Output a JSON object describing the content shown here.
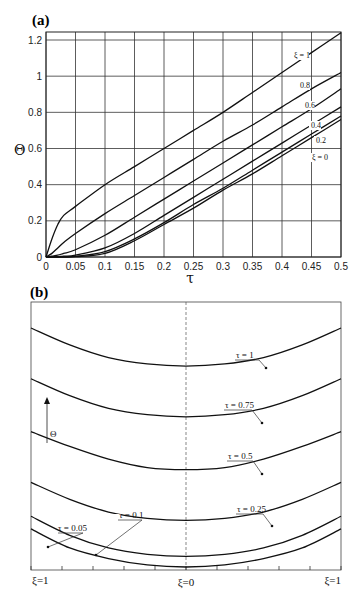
{
  "chart_data": [
    {
      "panel": "(a)",
      "type": "line",
      "title": "",
      "xlabel": "τ",
      "ylabel": "Θ",
      "xlim": [
        0,
        0.5
      ],
      "ylim": [
        0,
        1.25
      ],
      "grid": true,
      "x_ticks": [
        "0",
        "0.05",
        "0.1",
        "0.15",
        "0.2",
        "0.25",
        "0.3",
        "0.35",
        "0.4",
        "0.45",
        "0.5"
      ],
      "y_ticks": [
        "0",
        "0.2",
        "0.4",
        "0.6",
        "0.8",
        "1",
        "1.2"
      ],
      "x": [
        0,
        0.01,
        0.02,
        0.03,
        0.05,
        0.1,
        0.15,
        0.2,
        0.25,
        0.3,
        0.35,
        0.4,
        0.45,
        0.5
      ],
      "series": [
        {
          "name": "ξ=1",
          "label": "ξ = 1",
          "values": [
            0,
            0.1,
            0.18,
            0.23,
            0.28,
            0.4,
            0.5,
            0.6,
            0.7,
            0.8,
            0.91,
            1.02,
            1.13,
            1.24
          ]
        },
        {
          "name": "ξ=0.8",
          "label": "0.8",
          "values": [
            0,
            0.02,
            0.05,
            0.08,
            0.13,
            0.24,
            0.34,
            0.44,
            0.54,
            0.64,
            0.73,
            0.83,
            0.93,
            1.02
          ]
        },
        {
          "name": "ξ=0.6",
          "label": "0.6",
          "values": [
            0,
            0.005,
            0.01,
            0.02,
            0.04,
            0.12,
            0.22,
            0.32,
            0.42,
            0.52,
            0.62,
            0.72,
            0.82,
            0.93
          ]
        },
        {
          "name": "ξ=0.4",
          "label": "0.4",
          "values": [
            0,
            0,
            0.002,
            0.005,
            0.01,
            0.05,
            0.13,
            0.23,
            0.33,
            0.43,
            0.53,
            0.63,
            0.73,
            0.83
          ]
        },
        {
          "name": "ξ=0.2",
          "label": "0.2",
          "values": [
            0,
            0,
            0,
            0.001,
            0.003,
            0.03,
            0.1,
            0.19,
            0.29,
            0.38,
            0.48,
            0.58,
            0.68,
            0.78
          ]
        },
        {
          "name": "ξ=0",
          "label": "ξ = 0",
          "values": [
            0,
            0,
            0,
            0,
            0.002,
            0.02,
            0.09,
            0.18,
            0.27,
            0.37,
            0.46,
            0.56,
            0.66,
            0.76
          ]
        }
      ]
    },
    {
      "panel": "(b)",
      "type": "line",
      "title": "",
      "xlabel": "ξ",
      "ylabel": "Θ",
      "x_ticks": [
        "ξ=1",
        "ξ=0",
        "ξ=1"
      ],
      "annotation": "Θ (vertical arrow)",
      "centerline": "dashed at ξ=0",
      "x": [
        -1,
        -0.75,
        -0.5,
        -0.25,
        0,
        0.25,
        0.5,
        0.75,
        1
      ],
      "series": [
        {
          "name": "τ=1",
          "label": "τ = 1",
          "values": [
            1.13,
            1.05,
            0.99,
            0.96,
            0.95,
            0.96,
            0.99,
            1.05,
            1.13
          ]
        },
        {
          "name": "τ=0.75",
          "label": "τ = 0.75",
          "values": [
            0.89,
            0.81,
            0.75,
            0.72,
            0.71,
            0.72,
            0.75,
            0.81,
            0.89
          ]
        },
        {
          "name": "τ=0.5",
          "label": "τ = 0.5",
          "values": [
            0.64,
            0.57,
            0.51,
            0.47,
            0.46,
            0.47,
            0.51,
            0.57,
            0.64
          ]
        },
        {
          "name": "τ=0.25",
          "label": "τ = 0.25",
          "values": [
            0.4,
            0.32,
            0.26,
            0.23,
            0.22,
            0.23,
            0.26,
            0.32,
            0.4
          ]
        },
        {
          "name": "τ=0.1",
          "label": "τ = 0.1",
          "values": [
            0.24,
            0.15,
            0.09,
            0.06,
            0.05,
            0.06,
            0.09,
            0.15,
            0.24
          ]
        },
        {
          "name": "τ=0.05",
          "label": "τ = 0.05",
          "values": [
            0.18,
            0.09,
            0.04,
            0.01,
            0.0,
            0.01,
            0.04,
            0.09,
            0.18
          ]
        }
      ]
    }
  ],
  "labels": {
    "panel_a": "(a)",
    "panel_b": "(b)",
    "tau": "τ",
    "theta": "Θ",
    "xi_left": "ξ=1",
    "xi_center": "ξ=0",
    "xi_right": "ξ=1"
  }
}
